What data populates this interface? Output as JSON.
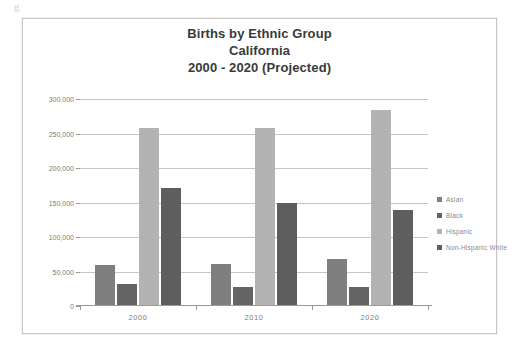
{
  "page": {
    "scan_artifact_text": "g"
  },
  "chart_data": {
    "type": "bar",
    "title": "Births by Ethnic Group California 2000 - 2020 (Projected)",
    "title_lines": [
      "Births by Ethnic Group",
      "California",
      "2000 - 2020 (Projected)"
    ],
    "xlabel": "",
    "ylabel": "",
    "categories": [
      "2000",
      "2010",
      "2020"
    ],
    "series": [
      {
        "name": "Asian",
        "color": "#7f7f7f",
        "values": [
          58000,
          59000,
          66000
        ]
      },
      {
        "name": "Black",
        "color": "#646464",
        "values": [
          30000,
          26000,
          26000
        ]
      },
      {
        "name": "Hispanic",
        "color": "#b3b3b3",
        "values": [
          257000,
          256000,
          282000
        ]
      },
      {
        "name": "Non-Hispanic White",
        "color": "#5e5e5e",
        "values": [
          170000,
          148000,
          138000
        ]
      }
    ],
    "ylim": [
      0,
      300000
    ],
    "ytick_values": [
      0,
      50000,
      100000,
      150000,
      200000,
      250000,
      300000
    ],
    "ytick_labels": [
      "0",
      "50,000",
      "100,000",
      "150,000",
      "200,000",
      "250,000",
      "300,000"
    ],
    "grid": true,
    "legend_position": "right",
    "legend": [
      "Asian",
      "Black",
      "Hispanic",
      "Non-Hispanic White"
    ],
    "annotations": []
  }
}
